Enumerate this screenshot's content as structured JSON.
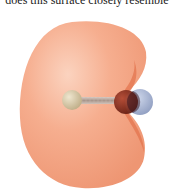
{
  "caption": {
    "text": "does this surface closely resemble"
  },
  "figure": {
    "surface": {
      "color": "#f4a483",
      "highlight": "#fbd3bf",
      "shade": "#e98a66",
      "notch_color": "#e06a45"
    },
    "atoms": [
      {
        "name": "left-atom",
        "color": "#d6c8a6",
        "cx": 72,
        "cy": 100,
        "r": 10
      },
      {
        "name": "right-atom",
        "color": "#8a2c1c",
        "cx": 126,
        "cy": 102,
        "r": 12
      },
      {
        "name": "lone-pair-lobe",
        "color": "#8e9fc4",
        "cx": 140,
        "cy": 102,
        "r": 13
      }
    ],
    "bond": {
      "color": "#b9aaa2"
    }
  }
}
